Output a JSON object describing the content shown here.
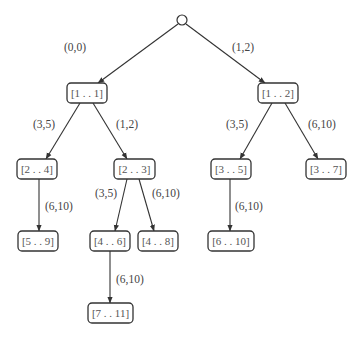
{
  "diagram": {
    "type": "tree",
    "root": {
      "shape": "circle",
      "x": 182,
      "y": 20,
      "r": 5
    },
    "nodes": [
      {
        "id": "n11",
        "label": "[1 . . 1]",
        "x": 67,
        "y": 83,
        "w": 40,
        "h": 20
      },
      {
        "id": "n12",
        "label": "[1 . . 2]",
        "x": 258,
        "y": 83,
        "w": 40,
        "h": 20
      },
      {
        "id": "n24",
        "label": "[2 . . 4]",
        "x": 17,
        "y": 159,
        "w": 40,
        "h": 20
      },
      {
        "id": "n23",
        "label": "[2 . . 3]",
        "x": 114,
        "y": 159,
        "w": 41,
        "h": 20
      },
      {
        "id": "n35",
        "label": "[3 . . 5]",
        "x": 211,
        "y": 159,
        "w": 40,
        "h": 20
      },
      {
        "id": "n37",
        "label": "[3 . . 7]",
        "x": 306,
        "y": 159,
        "w": 40,
        "h": 20
      },
      {
        "id": "n59",
        "label": "[5 . . 9]",
        "x": 18,
        "y": 231,
        "w": 40,
        "h": 20
      },
      {
        "id": "n46",
        "label": "[4 . . 6]",
        "x": 90,
        "y": 231,
        "w": 40,
        "h": 20
      },
      {
        "id": "n48",
        "label": "[4 . . 8]",
        "x": 138,
        "y": 231,
        "w": 40,
        "h": 20
      },
      {
        "id": "n610",
        "label": "[6 . . 10]",
        "x": 208,
        "y": 231,
        "w": 46,
        "h": 20
      },
      {
        "id": "n711",
        "label": "[7 . . 11]",
        "x": 88,
        "y": 303,
        "w": 45,
        "h": 20
      }
    ],
    "edges": [
      {
        "from": "root",
        "to": "n11",
        "label": "(0,0)",
        "x1": 178,
        "y1": 24,
        "x2": 98,
        "y2": 83,
        "lx": 64,
        "ly": 47
      },
      {
        "from": "root",
        "to": "n12",
        "label": "(1,2)",
        "x1": 186,
        "y1": 24,
        "x2": 265,
        "y2": 83,
        "lx": 232,
        "ly": 47
      },
      {
        "from": "n11",
        "to": "n24",
        "label": "(3,5)",
        "x1": 80,
        "y1": 103,
        "x2": 46,
        "y2": 159,
        "lx": 33,
        "ly": 124
      },
      {
        "from": "n11",
        "to": "n23",
        "label": "(1,2)",
        "x1": 93,
        "y1": 103,
        "x2": 127,
        "y2": 159,
        "lx": 116,
        "ly": 124
      },
      {
        "from": "n12",
        "to": "n35",
        "label": "(3,5)",
        "x1": 272,
        "y1": 103,
        "x2": 240,
        "y2": 159,
        "lx": 226,
        "ly": 124
      },
      {
        "from": "n12",
        "to": "n37",
        "label": "(6,10)",
        "x1": 285,
        "y1": 103,
        "x2": 318,
        "y2": 159,
        "lx": 308,
        "ly": 124
      },
      {
        "from": "n24",
        "to": "n59",
        "label": "(6,10)",
        "x1": 39,
        "y1": 179,
        "x2": 39,
        "y2": 231,
        "lx": 45,
        "ly": 206
      },
      {
        "from": "n23",
        "to": "n46",
        "label": "(3,5)",
        "x1": 127,
        "y1": 179,
        "x2": 115,
        "y2": 231,
        "lx": 95,
        "ly": 193
      },
      {
        "from": "n23",
        "to": "n48",
        "label": "(6,10)",
        "x1": 139,
        "y1": 179,
        "x2": 154,
        "y2": 231,
        "lx": 152,
        "ly": 193
      },
      {
        "from": "n35",
        "to": "n610",
        "label": "(6,10)",
        "x1": 230,
        "y1": 179,
        "x2": 230,
        "y2": 231,
        "lx": 235,
        "ly": 206
      },
      {
        "from": "n46",
        "to": "n711",
        "label": "(6,10)",
        "x1": 110,
        "y1": 251,
        "x2": 110,
        "y2": 303,
        "lx": 116,
        "ly": 279
      }
    ]
  }
}
